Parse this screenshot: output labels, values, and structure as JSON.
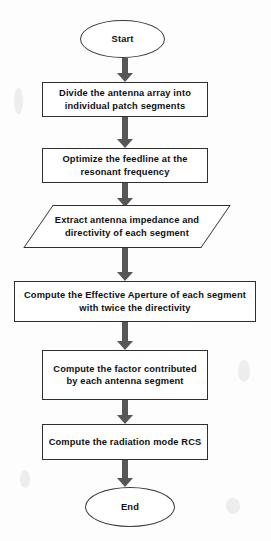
{
  "diagram": {
    "width": 271,
    "height": 541,
    "stroke_color": "#2f2f2f",
    "arrow_color": "#575757",
    "background_color": "#fdfdfd",
    "text_color": "#101010",
    "nodes": [
      {
        "id": "start",
        "type": "terminator",
        "label": "Start"
      },
      {
        "id": "divide-array",
        "type": "process",
        "label": "Divide the antenna array into individual patch segments"
      },
      {
        "id": "optimize-feedline",
        "type": "process",
        "label": "Optimize the feedline at the resonant frequency"
      },
      {
        "id": "extract-impedance",
        "type": "data",
        "label": "Extract antenna impedance and directivity of each segment"
      },
      {
        "id": "effective-aperture",
        "type": "process",
        "label": "Compute the Effective Aperture of each segment with twice the directivity"
      },
      {
        "id": "compute-factor",
        "type": "process",
        "label": "Compute the factor contributed by each antenna segment"
      },
      {
        "id": "radiation-rcs",
        "type": "process",
        "label": "Compute the radiation mode RCS"
      },
      {
        "id": "end",
        "type": "terminator",
        "label": "End"
      }
    ],
    "connectors": [
      {
        "id": "start-to-divide",
        "from": "start",
        "to": "divide-array",
        "direction": "down"
      },
      {
        "id": "divide-to-optimize",
        "from": "divide-array",
        "to": "optimize-feedline",
        "direction": "down"
      },
      {
        "id": "optimize-to-extract",
        "from": "optimize-feedline",
        "to": "extract-impedance",
        "direction": "down"
      },
      {
        "id": "extract-to-aperture",
        "from": "extract-impedance",
        "to": "effective-aperture",
        "direction": "down"
      },
      {
        "id": "aperture-to-factor",
        "from": "effective-aperture",
        "to": "compute-factor",
        "direction": "down"
      },
      {
        "id": "factor-to-rcs",
        "from": "compute-factor",
        "to": "radiation-rcs",
        "direction": "down"
      },
      {
        "id": "rcs-to-end",
        "from": "radiation-rcs",
        "to": "end",
        "direction": "down"
      }
    ]
  }
}
